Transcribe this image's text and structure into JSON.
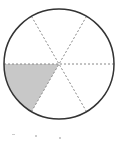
{
  "diagram": {
    "type": "fraction-circle",
    "total_parts": 6,
    "shaded_parts": 1,
    "fraction": "1/6",
    "center": [
      59,
      64
    ],
    "radius": 55,
    "colors": {
      "outline": "#333333",
      "divider": "#888888",
      "shade": "#c8c8c8",
      "background": "#ffffff"
    },
    "shaded_sector": {
      "start_deg": 180,
      "end_deg": 240
    }
  }
}
